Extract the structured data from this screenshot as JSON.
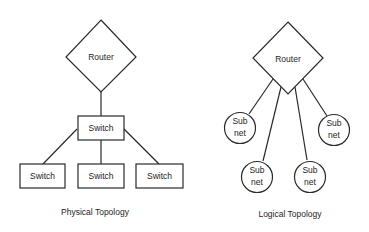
{
  "physical": {
    "caption": "Physical Topology",
    "router": {
      "label": "Router"
    },
    "core_switch": {
      "label": "Switch"
    },
    "access_switches": [
      {
        "label": "Switch"
      },
      {
        "label": "Switch"
      },
      {
        "label": "Switch"
      }
    ]
  },
  "logical": {
    "caption": "Logical Topology",
    "router": {
      "label": "Router"
    },
    "subnets": [
      {
        "line1": "Sub",
        "line2": "net"
      },
      {
        "line1": "Sub",
        "line2": "net"
      },
      {
        "line1": "Sub",
        "line2": "net"
      },
      {
        "line1": "Sub",
        "line2": "net"
      }
    ]
  },
  "colors": {
    "stroke": "#2a2a2a",
    "text": "#1e1e1e",
    "background": "#ffffff"
  }
}
